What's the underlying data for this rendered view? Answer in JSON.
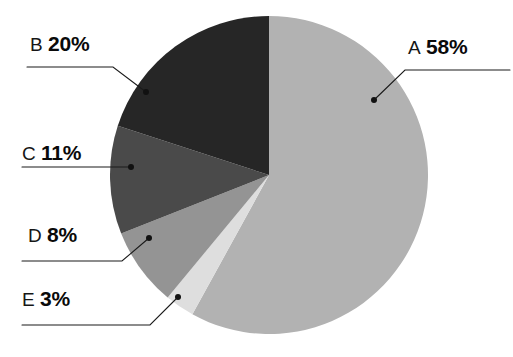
{
  "chart_data": {
    "type": "pie",
    "title": "",
    "subtitle": "",
    "xlabel": "",
    "ylabel": "",
    "legend_position": "callout-labels",
    "grid": false,
    "units": "percent",
    "total": 100,
    "categories": [
      "A",
      "B",
      "C",
      "D",
      "E"
    ],
    "values": [
      58,
      20,
      11,
      8,
      3
    ],
    "labels": [
      "58%",
      "20%",
      "11%",
      "8%",
      "3%"
    ],
    "start_angle_deg": 0,
    "direction": "clockwise",
    "slices": [
      {
        "key": "A",
        "value": 58,
        "label": "58%",
        "color": "#b2b2b2",
        "start_deg": 0,
        "end_deg": 208.8,
        "callout_side": "right"
      },
      {
        "key": "B",
        "value": 20,
        "label": "20%",
        "color": "#262626",
        "start_deg": 288.0,
        "end_deg": 360.0,
        "callout_side": "left"
      },
      {
        "key": "C",
        "value": 11,
        "label": "11%",
        "color": "#4a4a4a",
        "start_deg": 248.4,
        "end_deg": 288.0,
        "callout_side": "left"
      },
      {
        "key": "D",
        "value": 8,
        "label": "8%",
        "color": "#949494",
        "start_deg": 219.6,
        "end_deg": 248.4,
        "callout_side": "left"
      },
      {
        "key": "E",
        "value": 3,
        "label": "3%",
        "color": "#dedede",
        "start_deg": 208.8,
        "end_deg": 219.6,
        "callout_side": "left"
      }
    ]
  },
  "callouts": {
    "a": {
      "key": "A",
      "value": "58%"
    },
    "b": {
      "key": "B",
      "value": "20%"
    },
    "c": {
      "key": "C",
      "value": "11%"
    },
    "d": {
      "key": "D",
      "value": "8%"
    },
    "e": {
      "key": "E",
      "value": "3%"
    }
  },
  "style": {
    "background": "#ffffff",
    "leader_color": "#1a1a1a",
    "text_color": "#111111"
  }
}
